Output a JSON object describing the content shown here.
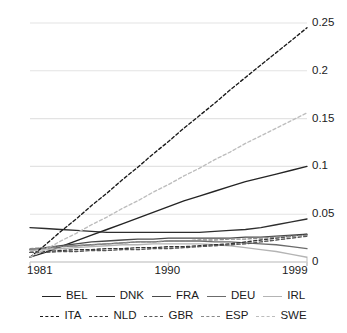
{
  "chart_data": {
    "type": "line",
    "title": "",
    "xlabel": "",
    "ylabel": "",
    "xlim": [
      1981,
      1999
    ],
    "ylim": [
      0,
      0.25
    ],
    "grid": true,
    "y_axis_side": "right",
    "legend_position": "bottom",
    "x_tick_labels": [
      "1981",
      "1990",
      "1999"
    ],
    "x_ticks": [
      1981,
      1990,
      1999
    ],
    "y_tick_labels": [
      "0",
      "0.05",
      "0.1",
      "0.15",
      "0.2",
      "0.25"
    ],
    "y_ticks": [
      0,
      0.05,
      0.1,
      0.15,
      0.2,
      0.25
    ],
    "x": [
      1981,
      1982,
      1983,
      1984,
      1985,
      1986,
      1987,
      1988,
      1989,
      1990,
      1991,
      1992,
      1993,
      1994,
      1995,
      1996,
      1997,
      1998,
      1999
    ],
    "series": [
      {
        "name": "BEL",
        "style": "solid",
        "color": "#242424",
        "values": [
          0.005,
          0.01,
          0.016,
          0.022,
          0.028,
          0.034,
          0.04,
          0.046,
          0.052,
          0.058,
          0.064,
          0.069,
          0.074,
          0.079,
          0.084,
          0.088,
          0.092,
          0.096,
          0.1
        ]
      },
      {
        "name": "DNK",
        "style": "solid",
        "color": "#2e2e2e",
        "values": [
          0.036,
          0.035,
          0.034,
          0.033,
          0.032,
          0.031,
          0.031,
          0.031,
          0.031,
          0.031,
          0.031,
          0.031,
          0.032,
          0.033,
          0.034,
          0.036,
          0.039,
          0.042,
          0.045
        ]
      },
      {
        "name": "FRA",
        "style": "solid",
        "color": "#4a4a4a",
        "values": [
          0.013,
          0.015,
          0.017,
          0.019,
          0.021,
          0.022,
          0.023,
          0.024,
          0.024,
          0.025,
          0.025,
          0.025,
          0.025,
          0.025,
          0.026,
          0.026,
          0.027,
          0.028,
          0.029
        ]
      },
      {
        "name": "DEU",
        "style": "solid",
        "color": "#6b6b6b",
        "values": [
          0.013,
          0.014,
          0.016,
          0.017,
          0.018,
          0.019,
          0.02,
          0.021,
          0.021,
          0.022,
          0.022,
          0.022,
          0.021,
          0.021,
          0.02,
          0.019,
          0.018,
          0.016,
          0.014
        ]
      },
      {
        "name": "IRL",
        "style": "solid",
        "color": "#b4b4b4",
        "values": [
          0.012,
          0.013,
          0.014,
          0.015,
          0.016,
          0.017,
          0.018,
          0.018,
          0.019,
          0.019,
          0.019,
          0.019,
          0.018,
          0.017,
          0.015,
          0.013,
          0.011,
          0.008,
          0.005
        ]
      },
      {
        "name": "ITA",
        "style": "dashed",
        "color": "#1a1a1a",
        "values": [
          0.005,
          0.018,
          0.032,
          0.045,
          0.059,
          0.072,
          0.086,
          0.099,
          0.113,
          0.126,
          0.14,
          0.153,
          0.166,
          0.18,
          0.193,
          0.206,
          0.219,
          0.232,
          0.245
        ]
      },
      {
        "name": "NLD",
        "style": "dashed",
        "color": "#343434",
        "values": [
          0.01,
          0.011,
          0.012,
          0.013,
          0.013,
          0.014,
          0.014,
          0.015,
          0.015,
          0.016,
          0.016,
          0.017,
          0.018,
          0.019,
          0.021,
          0.023,
          0.025,
          0.027,
          0.029
        ]
      },
      {
        "name": "GBR",
        "style": "dashed",
        "color": "#575757",
        "values": [
          0.01,
          0.01,
          0.011,
          0.011,
          0.012,
          0.012,
          0.013,
          0.013,
          0.014,
          0.014,
          0.015,
          0.016,
          0.017,
          0.018,
          0.019,
          0.021,
          0.023,
          0.025,
          0.027
        ]
      },
      {
        "name": "ESP",
        "style": "dashed",
        "color": "#8a8a8a",
        "values": [
          0.014,
          0.015,
          0.016,
          0.017,
          0.018,
          0.019,
          0.02,
          0.021,
          0.021,
          0.022,
          0.022,
          0.023,
          0.023,
          0.024,
          0.024,
          0.025,
          0.026,
          0.027,
          0.028
        ]
      },
      {
        "name": "SWE",
        "style": "dashed",
        "color": "#bdbdbd",
        "values": [
          0.005,
          0.013,
          0.022,
          0.03,
          0.039,
          0.047,
          0.056,
          0.064,
          0.073,
          0.081,
          0.09,
          0.098,
          0.107,
          0.115,
          0.124,
          0.132,
          0.14,
          0.148,
          0.156
        ]
      }
    ]
  },
  "legend": {
    "rows": [
      {
        "items": [
          "BEL",
          "DNK",
          "FRA",
          "DEU",
          "IRL"
        ]
      },
      {
        "items": [
          "ITA",
          "NLD",
          "GBR",
          "ESP",
          "SWE"
        ]
      }
    ]
  },
  "colors": {
    "grid": "#e3e3e3",
    "axis": "#cfcfcf",
    "text": "#1b1b1b",
    "background": "#ffffff"
  }
}
